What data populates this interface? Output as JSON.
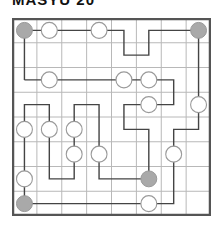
{
  "title": "MASYU 20",
  "puzzle": {
    "type": "masyu",
    "cols": 8,
    "rows": 8,
    "colors": {
      "grid_line": "#b8b8b8",
      "border": "#555555",
      "path": "#444444",
      "open_circle": "#9a9a9a",
      "filled_circle": "#a9a9a9"
    },
    "filled_circles": [
      [
        0,
        0
      ],
      [
        7,
        0
      ],
      [
        5,
        6
      ],
      [
        0,
        7
      ]
    ],
    "open_circles": [
      [
        1,
        0
      ],
      [
        3,
        0
      ],
      [
        1,
        2
      ],
      [
        4,
        2
      ],
      [
        5,
        2
      ],
      [
        5,
        3
      ],
      [
        7,
        3
      ],
      [
        0,
        4
      ],
      [
        1,
        4
      ],
      [
        2,
        4
      ],
      [
        2,
        5
      ],
      [
        3,
        5
      ],
      [
        6,
        5
      ],
      [
        0,
        6
      ],
      [
        5,
        7
      ]
    ],
    "path": [
      [
        0,
        2
      ],
      [
        6,
        2
      ],
      [
        6,
        3
      ],
      [
        4,
        3
      ],
      [
        4,
        4
      ],
      [
        5,
        4
      ],
      [
        5,
        6
      ],
      [
        3,
        6
      ],
      [
        3,
        3
      ],
      [
        2,
        3
      ],
      [
        2,
        6
      ],
      [
        1,
        6
      ],
      [
        1,
        3
      ],
      [
        0,
        3
      ],
      [
        0,
        7
      ],
      [
        6,
        7
      ],
      [
        6,
        4
      ],
      [
        7,
        4
      ],
      [
        7,
        0
      ],
      [
        5,
        0
      ],
      [
        5,
        1
      ],
      [
        4,
        1
      ],
      [
        4,
        0
      ],
      [
        0,
        0
      ],
      [
        0,
        2
      ]
    ]
  }
}
